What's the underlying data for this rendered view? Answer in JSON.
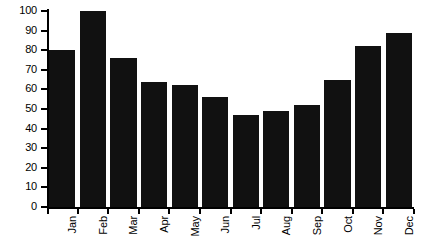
{
  "chart_data": {
    "type": "bar",
    "title": "",
    "subtitle": "",
    "xlabel": "",
    "ylabel": "",
    "categories": [
      "Jan",
      "Feb",
      "Mar",
      "Apr",
      "May",
      "Jun",
      "Jul",
      "Aug",
      "Sep",
      "Oct",
      "Nov",
      "Dec"
    ],
    "values": [
      80,
      100,
      76,
      64,
      62,
      56,
      47,
      49,
      52,
      65,
      82,
      89
    ],
    "ylim": [
      0,
      100
    ],
    "y_ticks": [
      0,
      10,
      20,
      30,
      40,
      50,
      60,
      70,
      80,
      90,
      100
    ],
    "y_tick_labels": [
      "0",
      "10",
      "20",
      "30",
      "40",
      "50",
      "60",
      "70",
      "80",
      "90",
      "100"
    ],
    "grid": false,
    "legend": null,
    "bar_color": "#111111",
    "axis_color": "#000000",
    "background": "#ffffff"
  }
}
